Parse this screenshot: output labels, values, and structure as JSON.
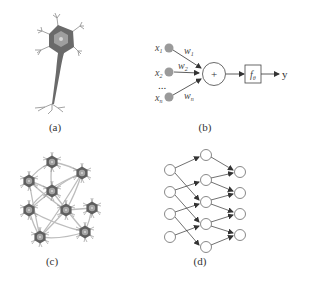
{
  "panels": {
    "a": {
      "label": "(a)",
      "description": "biological neuron"
    },
    "b": {
      "label": "(b)",
      "description": "artificial neuron model",
      "inputs": [
        {
          "var": "x",
          "sub": "1",
          "weight": "w",
          "weight_sub": "1"
        },
        {
          "var": "x",
          "sub": "2",
          "weight": "w",
          "weight_sub": "2"
        },
        {
          "var": "x",
          "sub": "n",
          "weight": "w",
          "weight_sub": "n"
        }
      ],
      "ellipsis": "...",
      "sum_symbol": "+",
      "activation": "f",
      "activation_sub": "θ",
      "output": "y"
    },
    "c": {
      "label": "(c)",
      "description": "biological neural network"
    },
    "d": {
      "label": "(d)",
      "description": "artificial neural network",
      "layers": [
        4,
        5,
        4
      ]
    }
  },
  "colors": {
    "neuron_body": "#6e6e6e",
    "neuron_nucleus": "#a8a8a8",
    "input_node": "#9a9a9a",
    "line": "#444444",
    "network_edge": "#b8b8b8"
  }
}
